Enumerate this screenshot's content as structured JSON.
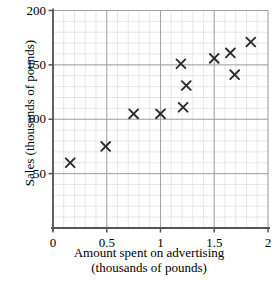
{
  "chart_data": {
    "type": "scatter",
    "title": "",
    "xlabel": "Amount spent on advertising (thousands of pounds)",
    "ylabel": "Sales (thousands of pounds)",
    "xlabel_line1": "Amount spent on advertising",
    "xlabel_line2": "(thousands of pounds)",
    "xlim": [
      0,
      2
    ],
    "ylim": [
      0,
      200
    ],
    "xticks": [
      0,
      0.5,
      1,
      1.5,
      2
    ],
    "xtick_labels": [
      "0",
      "0.5",
      "1",
      "1.5",
      "2"
    ],
    "yticks": [
      50,
      100,
      150,
      200
    ],
    "ytick_labels": [
      "50",
      "100",
      "150",
      "200"
    ],
    "grid": true,
    "grid_major_step_x": 0.5,
    "grid_major_step_y": 50,
    "grid_minor_step_x": 0.1,
    "grid_minor_step_y": 10,
    "marker": "x",
    "marker_color": "#2b2b2b",
    "grid_major_color": "#9a9a9a",
    "grid_minor_color": "#d8d8d8",
    "axis_color": "#555555",
    "legend": null,
    "x": [
      0.16,
      0.49,
      0.75,
      1.0,
      1.19,
      1.21,
      1.24,
      1.5,
      1.65,
      1.69,
      1.84
    ],
    "y": [
      60,
      75,
      105,
      105,
      151,
      111,
      131,
      156,
      161,
      141,
      171
    ],
    "points": [
      {
        "x": 0.16,
        "y": 60
      },
      {
        "x": 0.49,
        "y": 75
      },
      {
        "x": 0.75,
        "y": 105
      },
      {
        "x": 1.0,
        "y": 105
      },
      {
        "x": 1.19,
        "y": 151
      },
      {
        "x": 1.21,
        "y": 111
      },
      {
        "x": 1.24,
        "y": 131
      },
      {
        "x": 1.5,
        "y": 156
      },
      {
        "x": 1.65,
        "y": 161
      },
      {
        "x": 1.69,
        "y": 141
      },
      {
        "x": 1.84,
        "y": 171
      }
    ]
  }
}
